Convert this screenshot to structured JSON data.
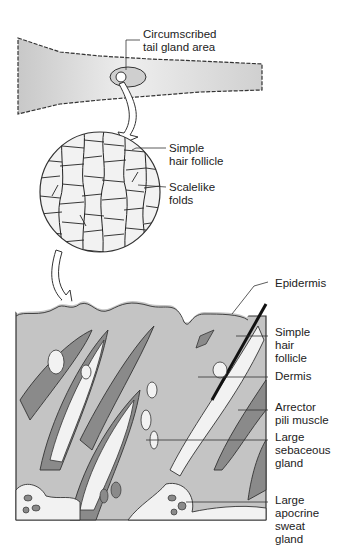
{
  "figure": {
    "panels": [
      "tail-overview",
      "magnified-surface",
      "skin-cross-section"
    ],
    "labels": {
      "tail_gland": "Circumscribed\ntail gland area",
      "hair_follicle_top": "Simple\nhair follicle",
      "scalelike_folds": "Scalelike\nfolds",
      "epidermis": "Epidermis",
      "hair_follicle_bottom": "Simple\nhair\nfollicle",
      "dermis": "Dermis",
      "arrector": "Arrector\npili muscle",
      "sebaceous": "Large\nsebaceous\ngland",
      "apocrine": "Large\napocrine\nsweat\ngland"
    },
    "colors": {
      "tissue": "#c4c4c4",
      "dark_tissue": "#8a8a8a",
      "light": "#f2f2f2",
      "outline": "#333333",
      "hair": "#111111"
    }
  }
}
